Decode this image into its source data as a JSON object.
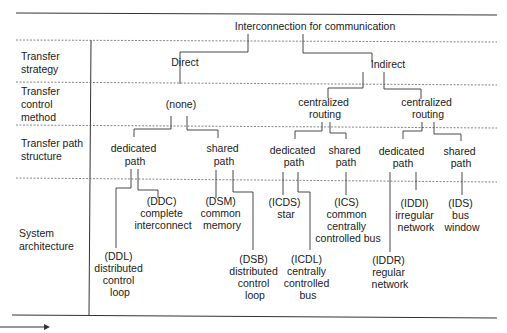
{
  "title": "Interconnection for communication",
  "rows": [
    {
      "label_lines": [
        "Transfer",
        "strategy"
      ]
    },
    {
      "label_lines": [
        "Transfer",
        "control",
        "method"
      ]
    },
    {
      "label_lines": [
        "Transfer path",
        "structure"
      ]
    },
    {
      "label_lines": [
        "System",
        "architecture"
      ]
    }
  ],
  "nodes": {
    "direct": "Direct",
    "indirect": "Indirect",
    "none": "(none)",
    "central_routing_1": [
      "centralized",
      "routing"
    ],
    "central_routing_2": [
      "centralized",
      "routing"
    ],
    "direct_dedicated": [
      "dedicated",
      "path"
    ],
    "direct_shared": [
      "shared",
      "path"
    ],
    "ind1_dedicated": [
      "dedicated",
      "path"
    ],
    "ind1_shared": [
      "shared",
      "path"
    ],
    "ind2_dedicated": [
      "dedicated",
      "path"
    ],
    "ind2_shared": [
      "shared",
      "path"
    ]
  },
  "architectures": {
    "ddl": [
      "(DDL)",
      "distributed",
      "control",
      "loop"
    ],
    "ddc": [
      "(DDC)",
      "complete",
      "interconnect"
    ],
    "dsm": [
      "(DSM)",
      "common",
      "memory"
    ],
    "dsb": [
      "(DSB)",
      "distributed",
      "control",
      "loop"
    ],
    "icds": [
      "(ICDS)",
      "star"
    ],
    "icdl": [
      "(ICDL)",
      "centrally",
      "controlled",
      "bus"
    ],
    "ics": [
      "(ICS)",
      "common",
      "centrally",
      "controlled bus"
    ],
    "iddr": [
      "(IDDR)",
      "regular",
      "network"
    ],
    "iddi": [
      "(IDDI)",
      "irregular",
      "network"
    ],
    "ids": [
      "(IDS)",
      "bus",
      "window"
    ]
  }
}
